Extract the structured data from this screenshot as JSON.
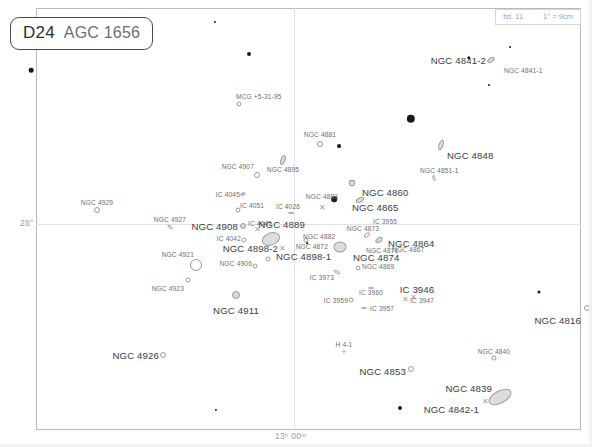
{
  "chart_data": {
    "type": "scatter",
    "title": "D24  AGC 1656",
    "subtitle": "Coma galaxy cluster star chart",
    "xlabel": "Right Ascension",
    "ylabel": "Declination",
    "grid": true,
    "legend_position": "none",
    "axis_ticks": {
      "dec_label": "28°",
      "ra_label": "13ʰ 00ᵐ"
    },
    "scale": {
      "limiting_magnitude": "fst. 11",
      "plate_scale": "1° = 9cm"
    },
    "series": [
      {
        "name": "galaxies",
        "points": [
          {
            "label": "MCG +5-31-95",
            "x": 239,
            "y": 104,
            "sym": "circle",
            "size": 5,
            "lx": 236,
            "ly": 96,
            "anchor": "left",
            "cls": "lbl"
          },
          {
            "label": "NGC 4841-2",
            "x": 491,
            "y": 60,
            "sym": "ellipse",
            "w": 8,
            "h": 5,
            "rot": -35,
            "lx": 486,
            "ly": 60,
            "anchor": "right",
            "cls": "lbl big"
          },
          {
            "label": "NGC 4841-1",
            "x": 497,
            "y": 78,
            "sym": "none",
            "lx": 504,
            "ly": 70,
            "anchor": "left",
            "cls": "lbl"
          },
          {
            "label": "NGC 4881",
            "x": 320,
            "y": 144,
            "sym": "circle",
            "size": 6,
            "lx": 320,
            "ly": 134,
            "anchor": "center",
            "cls": "lbl"
          },
          {
            "label": "NGC 4848",
            "x": 441,
            "y": 145,
            "sym": "ellipse",
            "w": 5,
            "h": 11,
            "rot": 20,
            "lx": 447,
            "ly": 155,
            "anchor": "left",
            "cls": "lbl big"
          },
          {
            "label": "NGC 4907",
            "x": 257,
            "y": 175,
            "sym": "circle",
            "size": 6,
            "lx": 254,
            "ly": 166,
            "anchor": "right",
            "cls": "lbl"
          },
          {
            "label": "NGC 4895",
            "x": 283,
            "y": 160,
            "sym": "ellipse",
            "w": 5,
            "h": 10,
            "rot": 20,
            "lx": 283,
            "ly": 169,
            "anchor": "center",
            "cls": "lbl"
          },
          {
            "label": "NGC 4851-1",
            "x": 434,
            "y": 178,
            "sym": "sliver",
            "w": 6,
            "h": 3,
            "rot": 70,
            "lx": 420,
            "ly": 170,
            "anchor": "left",
            "cls": "lbl"
          },
          {
            "label": "NGC 4860",
            "x": 352,
            "y": 183,
            "sym": "circle",
            "size": 7,
            "fill": true,
            "lx": 362,
            "ly": 192,
            "anchor": "left",
            "cls": "lbl big"
          },
          {
            "label": "NGC 4865",
            "x": 360,
            "y": 200,
            "sym": "ellipse",
            "w": 9,
            "h": 5,
            "rot": -30,
            "lx": 352,
            "ly": 207,
            "anchor": "left",
            "cls": "lbl big"
          },
          {
            "label": "NGC 4883",
            "x": 322,
            "y": 208,
            "sym": "x",
            "lx": 322,
            "ly": 196,
            "anchor": "center",
            "cls": "lbl"
          },
          {
            "label": "IC 4045",
            "x": 243,
            "y": 194,
            "sym": "ellipse",
            "w": 5,
            "h": 3,
            "rot": -20,
            "lx": 240,
            "ly": 194,
            "anchor": "right",
            "cls": "lbl"
          },
          {
            "label": "IC 4026",
            "x": 291,
            "y": 213,
            "sym": "sliver",
            "w": 6,
            "h": 2,
            "rot": 0,
            "lx": 288,
            "ly": 206,
            "anchor": "center",
            "cls": "lbl"
          },
          {
            "label": "IC 4051",
            "x": 238,
            "y": 210,
            "sym": "circle",
            "size": 5,
            "lx": 240,
            "ly": 205,
            "anchor": "left",
            "cls": "lbl"
          },
          {
            "label": "NGC 4929",
            "x": 97,
            "y": 210,
            "sym": "circle",
            "size": 6,
            "lx": 97,
            "ly": 202,
            "anchor": "center",
            "cls": "lbl"
          },
          {
            "label": "NGC 4927",
            "x": 170,
            "y": 227,
            "sym": "sliver",
            "w": 6,
            "h": 3,
            "rot": 35,
            "lx": 170,
            "ly": 219,
            "anchor": "center",
            "cls": "lbl"
          },
          {
            "label": "IC 4041",
            "x": 257,
            "y": 230,
            "sym": "x",
            "lx": 260,
            "ly": 223,
            "anchor": "center",
            "cls": "lbl"
          },
          {
            "label": "NGC 4908",
            "x": 243,
            "y": 226,
            "sym": "circle",
            "size": 6,
            "fill": true,
            "lx": 238,
            "ly": 226,
            "anchor": "right",
            "cls": "lbl big"
          },
          {
            "label": "IC 3955",
            "x": 385,
            "y": 221,
            "sym": "none",
            "lx": 385,
            "ly": 221,
            "anchor": "center",
            "cls": "lbl"
          },
          {
            "label": "NGC 4889",
            "x": 271,
            "y": 239,
            "sym": "ellipse",
            "w": 19,
            "h": 13,
            "rot": -20,
            "lx": 305,
            "ly": 224,
            "anchor": "right",
            "cls": "lbl big"
          },
          {
            "label": "NGC 4873",
            "x": 367,
            "y": 235,
            "sym": "sliver",
            "w": 7,
            "h": 4,
            "rot": -40,
            "lx": 363,
            "ly": 228,
            "anchor": "center",
            "cls": "lbl"
          },
          {
            "label": "NGC 4882",
            "x": 306,
            "y": 240,
            "sym": "circle",
            "size": 5,
            "lx": 303,
            "ly": 236,
            "anchor": "left",
            "cls": "lbl"
          },
          {
            "label": "IC 4042",
            "x": 244,
            "y": 240,
            "sym": "circle",
            "size": 5,
            "lx": 241,
            "ly": 238,
            "anchor": "right",
            "cls": "lbl"
          },
          {
            "label": "NGC 4864",
            "x": 379,
            "y": 240,
            "sym": "ellipse",
            "w": 8,
            "h": 5,
            "rot": -35,
            "lx": 388,
            "ly": 243,
            "anchor": "left",
            "cls": "lbl big"
          },
          {
            "label": "NGC 4867",
            "x": 389,
            "y": 247,
            "sym": "none",
            "lx": 392,
            "ly": 249,
            "anchor": "left",
            "cls": "lbl"
          },
          {
            "label": "NGC 4898-2",
            "x": 282,
            "y": 249,
            "sym": "x",
            "lx": 278,
            "ly": 248,
            "anchor": "right",
            "cls": "lbl big"
          },
          {
            "label": "NGC 4872",
            "x": 330,
            "y": 248,
            "sym": "none",
            "lx": 328,
            "ly": 246,
            "anchor": "right",
            "cls": "lbl"
          },
          {
            "label": "NGC 4874",
            "x": 340,
            "y": 247,
            "sym": "ellipse",
            "w": 13,
            "h": 11,
            "rot": 0,
            "lx": 353,
            "ly": 257,
            "anchor": "left",
            "cls": "lbl big"
          },
          {
            "label": "NGC 4871",
            "x": 366,
            "y": 249,
            "sym": "none",
            "lx": 366,
            "ly": 250,
            "anchor": "left",
            "cls": "lbl"
          },
          {
            "label": "NGC 4898-1",
            "x": 268,
            "y": 259,
            "sym": "circle",
            "size": 5,
            "lx": 276,
            "ly": 256,
            "anchor": "left",
            "cls": "lbl big"
          },
          {
            "label": "NGC 4921",
            "x": 196,
            "y": 265,
            "sym": "circle",
            "size": 12,
            "lx": 194,
            "ly": 254,
            "anchor": "right",
            "cls": "lbl"
          },
          {
            "label": "NGC 4906",
            "x": 255,
            "y": 266,
            "sym": "circle",
            "size": 5,
            "lx": 252,
            "ly": 263,
            "anchor": "right",
            "cls": "lbl"
          },
          {
            "label": "NGC 4869",
            "x": 358,
            "y": 268,
            "sym": "circle",
            "size": 5,
            "lx": 362,
            "ly": 266,
            "anchor": "left",
            "cls": "lbl"
          },
          {
            "label": "IC 3973",
            "x": 337,
            "y": 272,
            "sym": "sliver",
            "w": 7,
            "h": 3,
            "rot": 30,
            "lx": 334,
            "ly": 277,
            "anchor": "right",
            "cls": "lbl"
          },
          {
            "label": "NGC 4923",
            "x": 188,
            "y": 280,
            "sym": "circle",
            "size": 5,
            "lx": 184,
            "ly": 288,
            "anchor": "right",
            "cls": "lbl"
          },
          {
            "label": "IC 3960",
            "x": 371,
            "y": 288,
            "sym": "sliver",
            "w": 6,
            "h": 2,
            "rot": 0,
            "lx": 371,
            "ly": 292,
            "anchor": "center",
            "cls": "lbl"
          },
          {
            "label": "IC 3946",
            "x": 413,
            "y": 298,
            "sym": "x",
            "lx": 417,
            "ly": 289,
            "anchor": "center",
            "cls": "lbl big"
          },
          {
            "label": "IC 3947",
            "x": 405,
            "y": 300,
            "sym": "x",
            "lx": 410,
            "ly": 300,
            "anchor": "left",
            "cls": "lbl"
          },
          {
            "label": "IC 3959",
            "x": 351,
            "y": 300,
            "sym": "circle",
            "size": 5,
            "lx": 348,
            "ly": 300,
            "anchor": "right",
            "cls": "lbl"
          },
          {
            "label": "IC 3957",
            "x": 364,
            "y": 308,
            "sym": "sliver",
            "w": 6,
            "h": 2,
            "rot": 0,
            "lx": 370,
            "ly": 308,
            "anchor": "left",
            "cls": "lbl"
          },
          {
            "label": "NGC 4911",
            "x": 236,
            "y": 295,
            "sym": "circle",
            "size": 8,
            "fill": true,
            "lx": 236,
            "ly": 310,
            "anchor": "center",
            "cls": "lbl big"
          },
          {
            "label": "NGC 4816",
            "x": 587,
            "y": 308,
            "sym": "circle",
            "size": 6,
            "lx": 581,
            "ly": 320,
            "anchor": "right",
            "cls": "lbl big"
          },
          {
            "label": "NGC 4926",
            "x": 163,
            "y": 355,
            "sym": "circle",
            "size": 6,
            "lx": 159,
            "ly": 355,
            "anchor": "right",
            "cls": "lbl big"
          },
          {
            "label": "H 4-1",
            "x": 344,
            "y": 352,
            "sym": "plus",
            "lx": 344,
            "ly": 344,
            "anchor": "center",
            "cls": "lbl"
          },
          {
            "label": "NGC 4840",
            "x": 494,
            "y": 358,
            "sym": "circle",
            "size": 5,
            "lx": 494,
            "ly": 351,
            "anchor": "center",
            "cls": "lbl"
          },
          {
            "label": "NGC 4853",
            "x": 411,
            "y": 369,
            "sym": "circle",
            "size": 6,
            "lx": 406,
            "ly": 371,
            "anchor": "right",
            "cls": "lbl big"
          },
          {
            "label": "NGC 4839",
            "x": 500,
            "y": 397,
            "sym": "ellipse",
            "w": 25,
            "h": 13,
            "rot": -28,
            "lx": 492,
            "ly": 388,
            "anchor": "right",
            "cls": "lbl big"
          },
          {
            "label": "NGC 4842-1",
            "x": 485,
            "y": 402,
            "sym": "x",
            "lx": 479,
            "ly": 409,
            "anchor": "right",
            "cls": "lbl big"
          }
        ]
      },
      {
        "name": "field-stars",
        "points": [
          {
            "x": 215,
            "y": 22,
            "mag": 9.0,
            "r": 1.1
          },
          {
            "x": 249,
            "y": 54,
            "mag": 7.6,
            "r": 2.0
          },
          {
            "x": 31,
            "y": 70,
            "mag": 7.3,
            "r": 2.3
          },
          {
            "x": 469,
            "y": 58,
            "mag": 8.2,
            "r": 1.7
          },
          {
            "x": 510,
            "y": 47,
            "mag": 9.4,
            "r": 1.0
          },
          {
            "x": 489,
            "y": 85,
            "mag": 9.3,
            "r": 1.1
          },
          {
            "x": 411,
            "y": 119,
            "mag": 6.3,
            "r": 4.2
          },
          {
            "x": 339,
            "y": 146,
            "mag": 8.0,
            "r": 1.9
          },
          {
            "x": 334,
            "y": 199,
            "mag": 7.0,
            "r": 2.8
          },
          {
            "x": 539,
            "y": 292,
            "mag": 8.3,
            "r": 1.6
          },
          {
            "x": 216,
            "y": 410,
            "mag": 9.2,
            "r": 1.1
          },
          {
            "x": 400,
            "y": 408,
            "mag": 7.8,
            "r": 2.0
          },
          {
            "x": 307,
            "y": 243,
            "mag": 9.6,
            "r": 0.9
          }
        ]
      }
    ],
    "gridlines": {
      "horizontal": [
        {
          "y": 224,
          "label": "28°"
        }
      ],
      "vertical": [
        {
          "x": 294,
          "label": "13ʰ 00ᵐ"
        }
      ]
    }
  },
  "title": {
    "code": "D24",
    "name": "AGC 1656"
  },
  "scale_box": {
    "limiting_magnitude": "fst. 11",
    "plate_scale": "1° = 9cm"
  },
  "axes": {
    "dec": "28°",
    "ra": "13ʰ 00ᵐ"
  }
}
